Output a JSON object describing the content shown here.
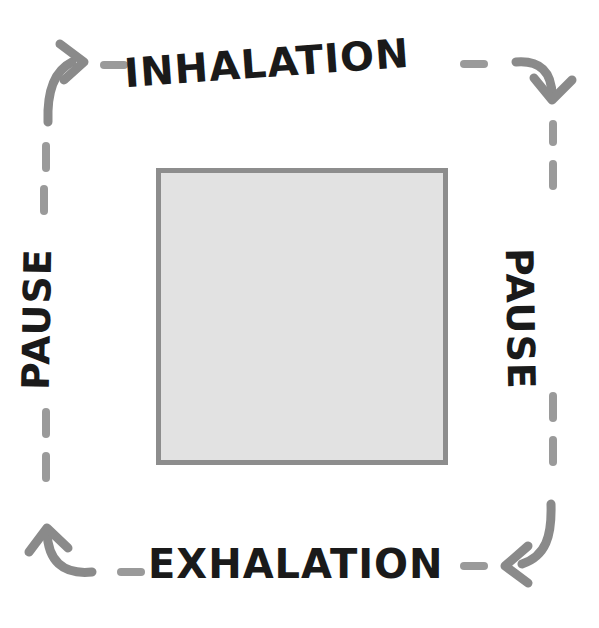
{
  "diagram": {
    "type": "breathing-cycle-square",
    "phases": [
      {
        "id": "inhalation",
        "label": "INHALATION",
        "position": "top",
        "direction": "left-to-right"
      },
      {
        "id": "pause-right",
        "label": "PAUSE",
        "position": "right",
        "direction": "top-to-bottom"
      },
      {
        "id": "exhalation",
        "label": "EXHALATION",
        "position": "bottom",
        "direction": "right-to-left"
      },
      {
        "id": "pause-left",
        "label": "PAUSE",
        "position": "left",
        "direction": "bottom-to-top"
      }
    ],
    "labels": {
      "inhalation": "INHALATION",
      "exhalation": "EXHALATION",
      "pause_left": "PAUSE",
      "pause_right": "PAUSE"
    },
    "arrows": [
      {
        "id": "arrow-top-left",
        "corner": "top-left",
        "points": "up-right"
      },
      {
        "id": "arrow-top-right",
        "corner": "top-right",
        "points": "down"
      },
      {
        "id": "arrow-bottom-right",
        "corner": "bottom-right",
        "points": "left"
      },
      {
        "id": "arrow-bottom-left",
        "corner": "bottom-left",
        "points": "up"
      }
    ],
    "center_shape": {
      "id": "breath-square",
      "shape": "square",
      "fill": "#e2e2e2",
      "stroke": "#8d8d8d"
    },
    "colors": {
      "background": "#ffffff",
      "text": "#1a1a1a",
      "arrow": "#8a8a8a",
      "dash": "#9a9a9a",
      "square_fill": "#e2e2e2",
      "square_stroke": "#8d8d8d"
    }
  }
}
